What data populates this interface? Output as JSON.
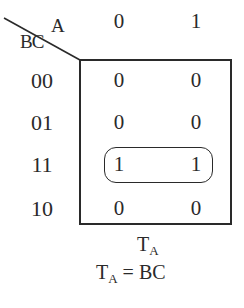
{
  "kmap": {
    "column_variable": "A",
    "row_variable": "BC",
    "columns": [
      "0",
      "1"
    ],
    "rows": [
      "00",
      "01",
      "11",
      "10"
    ],
    "cells": [
      [
        "0",
        "0"
      ],
      [
        "0",
        "0"
      ],
      [
        "1",
        "1"
      ],
      [
        "0",
        "0"
      ]
    ],
    "grouping": {
      "row": "11",
      "columns": [
        "0",
        "1"
      ]
    },
    "map_label": {
      "base": "T",
      "sub": "A"
    },
    "equation": {
      "lhs_base": "T",
      "lhs_sub": "A",
      "op": "=",
      "rhs": "BC"
    }
  }
}
